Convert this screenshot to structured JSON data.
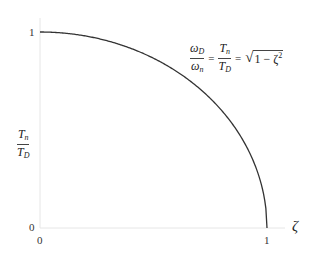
{
  "chart_data": {
    "type": "line",
    "title": "",
    "xlabel": "ζ",
    "ylabel": "T_n / T_D",
    "xlim": [
      0,
      1
    ],
    "ylim": [
      0,
      1
    ],
    "x_ticks": [
      "0",
      "1"
    ],
    "y_ticks": [
      "0",
      "1"
    ],
    "grid": false,
    "annotation": "ω_D/ω_n = T_n/T_D = √(1 − ζ²)",
    "series": [
      {
        "name": "sqrt(1 - zeta^2)",
        "x": [
          0,
          0.1,
          0.2,
          0.3,
          0.4,
          0.5,
          0.6,
          0.7,
          0.8,
          0.9,
          0.95,
          1.0
        ],
        "y": [
          1.0,
          0.995,
          0.98,
          0.954,
          0.917,
          0.866,
          0.8,
          0.714,
          0.6,
          0.436,
          0.312,
          0.0
        ]
      }
    ],
    "colors": {
      "curve": "#333333",
      "axes": "#e6e6e6"
    }
  },
  "labels": {
    "y_tick_top": "1",
    "y_tick_bottom": "0",
    "x_tick_left": "0",
    "x_tick_right": "1",
    "x_axis": "ζ",
    "y_num_main": "T",
    "y_num_sub": "n",
    "y_den_main": "T",
    "y_den_sub": "D",
    "eq_f1_num_main": "ω",
    "eq_f1_num_sub": "D",
    "eq_f1_den_main": "ω",
    "eq_f1_den_sub": "n",
    "eq_eq1": "=",
    "eq_f2_num_main": "T",
    "eq_f2_num_sub": "n",
    "eq_f2_den_main": "T",
    "eq_f2_den_sub": "D",
    "eq_eq2": "=",
    "eq_sqrt_symbol": "√",
    "eq_radicand": "1 − ζ",
    "eq_exp": "2"
  }
}
